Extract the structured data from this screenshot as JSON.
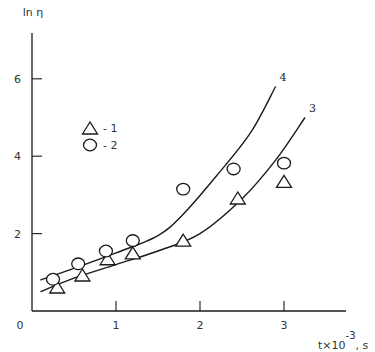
{
  "chart_data": {
    "type": "scatter",
    "title": "",
    "xlabel": "t×10^-3, s",
    "xlabel_parts": {
      "base": "t×10",
      "exponent": "-3",
      "suffix": ", s"
    },
    "ylabel": "ln η",
    "origin_label": "0",
    "xlim": [
      0,
      3.7
    ],
    "ylim": [
      0,
      7
    ],
    "x_ticks": [
      1,
      2,
      3
    ],
    "x_tick_labels": [
      "1",
      "2",
      "3"
    ],
    "y_ticks": [
      2,
      4,
      6
    ],
    "y_tick_labels": [
      "2",
      "4",
      "6"
    ],
    "grid": false,
    "legend": {
      "position": "upper-left",
      "entries": [
        {
          "marker": "triangle",
          "label": "- 1"
        },
        {
          "marker": "circle",
          "label": "- 2"
        }
      ]
    },
    "series": [
      {
        "name": "1",
        "marker": "triangle",
        "x": [
          0.3,
          0.6,
          0.9,
          1.2,
          1.8,
          2.45,
          3.0
        ],
        "y": [
          0.62,
          0.93,
          1.35,
          1.5,
          1.83,
          2.92,
          3.35
        ]
      },
      {
        "name": "2",
        "marker": "circle",
        "x": [
          0.25,
          0.55,
          0.88,
          1.2,
          1.8,
          2.4,
          3.0
        ],
        "y": [
          0.82,
          1.22,
          1.55,
          1.82,
          3.15,
          3.67,
          3.82
        ]
      },
      {
        "name": "4",
        "type": "line",
        "label": "4",
        "x": [
          0.1,
          0.5,
          1.0,
          1.5,
          1.8,
          2.2,
          2.6,
          2.9
        ],
        "y": [
          0.8,
          1.1,
          1.5,
          1.95,
          2.5,
          3.5,
          4.6,
          5.8
        ]
      },
      {
        "name": "3",
        "type": "line",
        "label": "3",
        "x": [
          0.1,
          0.5,
          1.0,
          1.5,
          2.0,
          2.5,
          2.9,
          3.25
        ],
        "y": [
          0.5,
          0.85,
          1.2,
          1.55,
          2.0,
          2.9,
          3.9,
          5.0
        ]
      }
    ]
  }
}
